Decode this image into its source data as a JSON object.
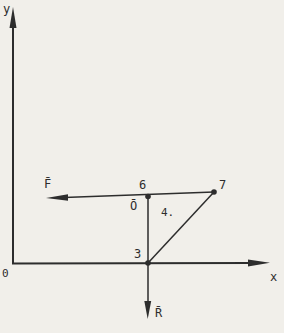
{
  "figure": {
    "type": "vector-force-diagram",
    "background_color": "#f1efea",
    "line_color": "#2d2d2d",
    "axes": {
      "y_label": "y",
      "x_label": "x",
      "origin_label": "0"
    },
    "points": {
      "point_6_label": "6",
      "point_o_label": "Ō",
      "point_7_label": "7",
      "point_3_label": "3"
    },
    "vectors": {
      "force_f_label": "F̄",
      "force_f_direction": "left",
      "force_r_label": "R̄",
      "force_r_direction": "down"
    },
    "annotations": {
      "segment_length_label": "4."
    }
  }
}
